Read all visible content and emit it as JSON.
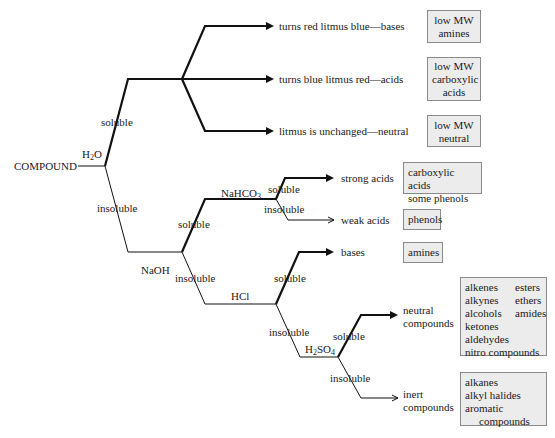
{
  "diagram": {
    "start": "COMPOUND",
    "reagents": {
      "water": {
        "base": "H",
        "sub": "2",
        "tail": "O"
      },
      "naoh": "NaOH",
      "nahco3": {
        "base": "NaHCO",
        "sub": "3"
      },
      "hcl": "HCl",
      "h2so4": {
        "base": "H",
        "sub": "2",
        "mid": "SO",
        "sub2": "4"
      }
    },
    "branch_labels": {
      "soluble": "soluble",
      "insoluble": "insoluble"
    },
    "outcomes": {
      "litmus_bases": "turns red litmus blue—bases",
      "litmus_acids": "turns blue litmus red—acids",
      "litmus_neutral": "litmus is unchanged—neutral",
      "strong_acids": "strong acids",
      "weak_acids": "weak acids",
      "bases": "bases",
      "neutral_compounds": [
        "neutral",
        "compounds"
      ],
      "inert_compounds": [
        "inert",
        "compounds"
      ]
    },
    "boxes": {
      "low_mw_amines": [
        "low MW",
        "amines"
      ],
      "low_mw_carboxylic": [
        "low MW",
        "carboxylic",
        "acids"
      ],
      "low_mw_neutral": [
        "low MW",
        "neutral"
      ],
      "carboxylic_phenols": [
        "carboxylic acids",
        "some phenols"
      ],
      "phenols": [
        "phenols"
      ],
      "amines": [
        "amines"
      ],
      "neutral_list": {
        "rows": [
          [
            "alkenes",
            "esters"
          ],
          [
            "alkynes",
            "ethers"
          ],
          [
            "alcohols",
            "amides"
          ],
          [
            "ketones"
          ],
          [
            "aldehydes"
          ],
          [
            "nitro compounds"
          ]
        ]
      },
      "inert_list": [
        "alkanes",
        "alkyl halides",
        "aromatic",
        "compounds"
      ]
    },
    "colors": {
      "line": "#111111",
      "box_fill": "#ececec",
      "box_border": "#8a8a8a"
    }
  }
}
